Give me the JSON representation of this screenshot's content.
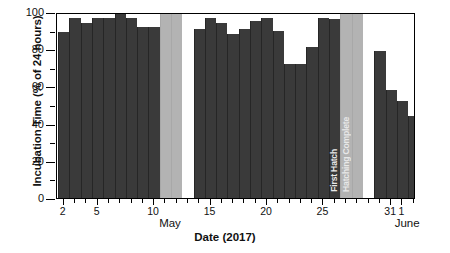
{
  "chart_data": {
    "type": "bar",
    "title": "",
    "xlabel": "Date (2017)",
    "ylabel": "Incubation Time (% of 24 hours)",
    "ylim": [
      0,
      100
    ],
    "yticks": [
      0,
      20,
      40,
      60,
      80,
      100
    ],
    "ytick_labels": [
      "0",
      "20",
      "40",
      "60",
      "80",
      "100"
    ],
    "yminor_ticks": [
      10,
      30,
      50,
      70,
      90
    ],
    "grid": false,
    "legend": null,
    "xtick_labels": [
      "2",
      "5",
      "10",
      "15",
      "20",
      "25",
      "31",
      "1"
    ],
    "xtick_days": [
      2,
      5,
      10,
      15,
      20,
      25,
      31,
      32
    ],
    "month_labels": [
      {
        "text": "May",
        "day": 11.5
      },
      {
        "text": "June",
        "day": 32.5
      }
    ],
    "annotations": [
      {
        "text": "First Hatch",
        "day": 25.5
      },
      {
        "text": "Hatching Complete",
        "day": 26.6
      }
    ],
    "x_range": [
      1.4,
      33.2
    ],
    "bar_color": "#3a3a3a",
    "gap_color": "#b3b3b3",
    "categories": [
      "May 2",
      "May 3",
      "May 4",
      "May 5",
      "May 6",
      "May 7",
      "May 8",
      "May 9",
      "May 10",
      "May 11",
      "May 12",
      "May 13",
      "May 14",
      "May 15",
      "May 16",
      "May 17",
      "May 18",
      "May 19",
      "May 20",
      "May 21",
      "May 22",
      "May 23",
      "May 24",
      "May 25",
      "May 26",
      "May 27",
      "May 28",
      "May 29",
      "May 30",
      "May 31",
      "June 1",
      "June 2",
      "June 3"
    ],
    "values": [
      89,
      97,
      94,
      97,
      97,
      100,
      97,
      92,
      92,
      91,
      null,
      null,
      91,
      97,
      94,
      88,
      91,
      95,
      97,
      90,
      72,
      72,
      81,
      97,
      96,
      88,
      null,
      null,
      79,
      58,
      52,
      44,
      null
    ],
    "series": [
      {
        "name": "Incubation Time",
        "values": [
          89,
          97,
          94,
          97,
          97,
          100,
          97,
          92,
          92,
          91,
          null,
          null,
          91,
          97,
          94,
          88,
          91,
          95,
          97,
          90,
          72,
          72,
          81,
          97,
          96,
          88,
          null,
          null,
          79,
          58,
          52,
          44,
          null
        ]
      }
    ],
    "missing_data_days": [
      11,
      12,
      27,
      28
    ],
    "units": "% of 24 hours"
  }
}
